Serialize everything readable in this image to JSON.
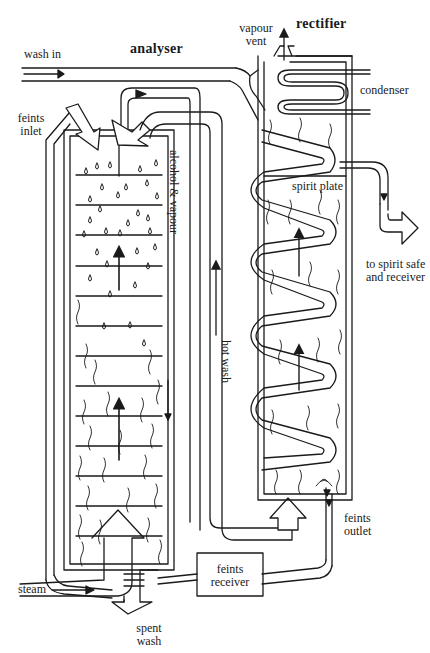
{
  "diagram": {
    "type": "coffey-still-schematic",
    "columns": {
      "analyser": {
        "title": "analyser"
      },
      "rectifier": {
        "title": "rectifier"
      }
    },
    "labels": {
      "wash_in": "wash in",
      "feints_inlet_1": "feints",
      "feints_inlet_2": "inlet",
      "vapour_vent_1": "vapour",
      "vapour_vent_2": "vent",
      "condenser": "condenser",
      "spirit_plate": "spirit plate",
      "to_spirit_safe_1": "to spirit safe",
      "to_spirit_safe_2": "and receiver",
      "alcohol_vapour": "alcohol & vapour",
      "hot_wash": "hot wash",
      "feints_outlet_1": "feints",
      "feints_outlet_2": "outlet",
      "feints_receiver_1": "feints",
      "feints_receiver_2": "receiver",
      "steam": "steam",
      "spent_wash_1": "spent",
      "spent_wash_2": "wash"
    },
    "colors": {
      "ink": "#1a1a1a",
      "paper": "#ffffff"
    }
  }
}
